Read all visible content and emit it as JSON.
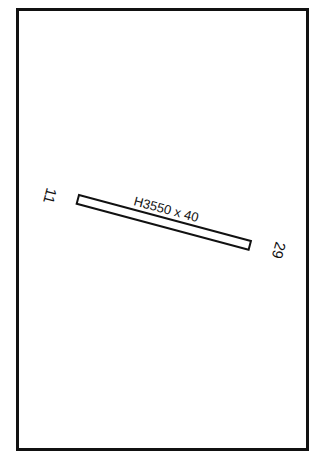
{
  "diagram": {
    "type": "airport-runway-diagram",
    "runway": {
      "dimension_label": "H3550 x 40",
      "end_left": "11",
      "end_right": "29",
      "angle_deg": 15
    },
    "colors": {
      "stroke": "#111111",
      "background": "#ffffff"
    }
  }
}
